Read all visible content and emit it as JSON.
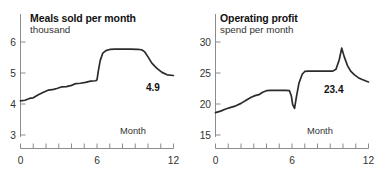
{
  "figure": {
    "background": "#ffffff",
    "line_color": "#2b2b2b",
    "axis_color": "#8c8c8c",
    "text_color": "#33332f",
    "title_color": "#111111",
    "panel_count": 2
  },
  "panels": [
    {
      "id": "meals-sold",
      "title": "Meals sold per month",
      "subtitle": "thousand",
      "value_label": "4.9",
      "axis_caption": "Month"
    },
    {
      "id": "operating-profit",
      "title": "Operating profit",
      "subtitle": "spend per month",
      "value_label": "23.4",
      "axis_caption": "Month"
    }
  ],
  "chart_data": [
    {
      "type": "line",
      "title": "Meals sold per month",
      "subtitle": "thousand",
      "xlabel": "Month",
      "ylabel": "thousand",
      "xlim": [
        0,
        12
      ],
      "ylim": [
        3,
        6.3
      ],
      "yticks": [
        3,
        4,
        5,
        6
      ],
      "ytick_labels": [
        "3",
        "4",
        "5",
        "6"
      ],
      "xticks": [
        0,
        1,
        2,
        3,
        4,
        5,
        6,
        7,
        8,
        9,
        10,
        11,
        12
      ],
      "xtick_labels": [
        "0",
        "",
        "",
        "",
        "",
        "",
        "6",
        "",
        "",
        "",
        "",
        "",
        "12"
      ],
      "grid": false,
      "legend": null,
      "annotations": [
        {
          "text": "4.9",
          "x": 11.0,
          "y": 4.62
        }
      ],
      "series": [
        {
          "name": "Meals sold per month",
          "color": "#2b2b2b",
          "x": [
            0.0,
            0.35,
            0.7,
            1.0,
            1.4,
            1.8,
            2.2,
            2.6,
            2.85,
            3.2,
            3.6,
            4.0,
            4.35,
            4.7,
            5.1,
            5.5,
            5.9,
            6.0,
            6.1,
            6.25,
            6.45,
            6.7,
            7.0,
            7.4,
            8.0,
            8.6,
            9.2,
            9.5,
            9.75,
            10.0,
            10.3,
            10.7,
            11.1,
            11.5,
            12.0
          ],
          "y": [
            4.1,
            4.12,
            4.18,
            4.2,
            4.3,
            4.38,
            4.45,
            4.47,
            4.5,
            4.55,
            4.56,
            4.6,
            4.66,
            4.67,
            4.7,
            4.74,
            4.75,
            4.78,
            5.05,
            5.4,
            5.64,
            5.72,
            5.76,
            5.77,
            5.77,
            5.77,
            5.76,
            5.75,
            5.68,
            5.52,
            5.32,
            5.15,
            5.02,
            4.94,
            4.92
          ]
        }
      ]
    },
    {
      "type": "line",
      "title": "Operating profit",
      "subtitle": "spend per month",
      "xlabel": "Month",
      "ylabel": "spend per month",
      "xlim": [
        0,
        12
      ],
      "ylim": [
        15,
        32
      ],
      "yticks": [
        15,
        20,
        25,
        30
      ],
      "ytick_labels": [
        "15",
        "20",
        "25",
        "30"
      ],
      "xticks": [
        0,
        1,
        2,
        3,
        4,
        5,
        6,
        7,
        8,
        9,
        10,
        11,
        12
      ],
      "xtick_labels": [
        "0",
        "",
        "",
        "",
        "",
        "",
        "6",
        "",
        "",
        "",
        "",
        "",
        "12"
      ],
      "grid": false,
      "legend": null,
      "annotations": [
        {
          "text": "23.4",
          "x": 10.6,
          "y": 21.6
        }
      ],
      "series": [
        {
          "name": "Operating profit spend per month",
          "color": "#2b2b2b",
          "x": [
            0.0,
            0.4,
            0.8,
            1.2,
            1.6,
            2.0,
            2.4,
            2.8,
            3.1,
            3.4,
            3.7,
            4.0,
            4.3,
            4.7,
            5.1,
            5.5,
            5.8,
            5.95,
            6.05,
            6.2,
            6.35,
            6.55,
            6.8,
            7.0,
            7.3,
            7.7,
            8.2,
            8.8,
            9.2,
            9.45,
            9.7,
            9.9,
            10.1,
            10.35,
            10.6,
            10.9,
            11.2,
            11.5,
            11.8,
            12.0
          ],
          "y": [
            18.6,
            18.85,
            19.2,
            19.45,
            19.7,
            20.1,
            20.6,
            21.1,
            21.35,
            21.5,
            21.9,
            22.15,
            22.2,
            22.2,
            22.2,
            22.2,
            22.15,
            21.3,
            19.95,
            19.3,
            21.2,
            23.4,
            24.8,
            25.25,
            25.3,
            25.3,
            25.3,
            25.3,
            25.3,
            25.6,
            27.1,
            29.0,
            27.6,
            26.2,
            25.3,
            24.7,
            24.25,
            23.95,
            23.7,
            23.55
          ]
        }
      ]
    }
  ]
}
